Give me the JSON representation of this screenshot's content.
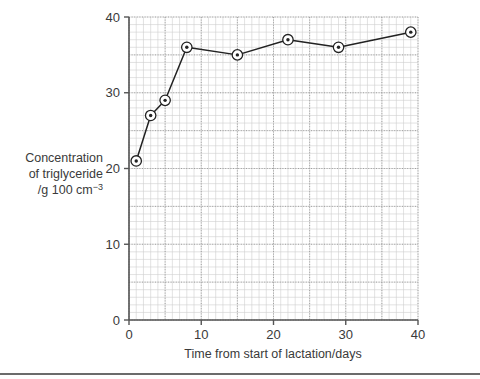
{
  "chart_data": {
    "type": "line",
    "title": "",
    "subtitle": "",
    "xlabel": "Time from start of lactation/days",
    "ylabel": "Concentration of triglyceride /g 100 cm⁻³",
    "ylabel_lines": [
      "Concentration",
      "of triglyceride",
      "/g 100 cm"
    ],
    "ylabel_superscript": "−3",
    "xlim": [
      0,
      40
    ],
    "ylim": [
      0,
      40
    ],
    "xticks": [
      0,
      10,
      20,
      30,
      40
    ],
    "yticks": [
      0,
      10,
      20,
      30,
      40
    ],
    "xtick_labels": [
      "0",
      "10",
      "20",
      "30",
      "40"
    ],
    "ytick_labels": [
      "0",
      "10",
      "20",
      "30",
      "40"
    ],
    "grid": true,
    "grid_minor_step": 1,
    "grid_major_step": 5,
    "legend": "none",
    "marker": "circle-with-center-dot",
    "line_color": "#222222",
    "marker_edge_color": "#222222",
    "marker_face_color": "#ffffff",
    "grid_minor_color": "#cfcfcf",
    "grid_major_color": "#8f8f8f",
    "axis_color": "#555555",
    "x": [
      1,
      3,
      5,
      8,
      15,
      22,
      29,
      39
    ],
    "values": [
      21,
      27,
      29,
      36,
      35,
      37,
      36,
      38
    ],
    "series": [
      {
        "name": "Triglyceride concentration",
        "points": [
          {
            "x": 1,
            "y": 21
          },
          {
            "x": 3,
            "y": 27
          },
          {
            "x": 5,
            "y": 29
          },
          {
            "x": 8,
            "y": 36
          },
          {
            "x": 15,
            "y": 35
          },
          {
            "x": 22,
            "y": 37
          },
          {
            "x": 29,
            "y": 36
          },
          {
            "x": 39,
            "y": 38
          }
        ]
      }
    ]
  },
  "figure": {
    "background_color": "#ffffff",
    "divider_color": "#6b6b6b"
  }
}
